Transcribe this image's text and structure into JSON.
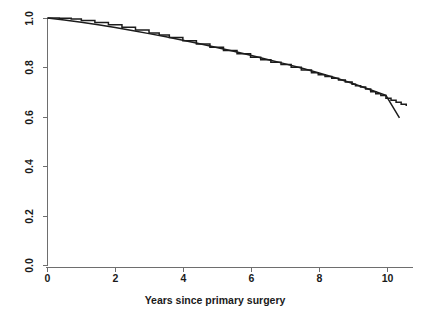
{
  "chart_data": {
    "type": "line",
    "title": "",
    "subtitle": "",
    "xlabel": "Years since primary surgery",
    "ylabel": "",
    "xlim": [
      0,
      10.8
    ],
    "ylim": [
      0.0,
      1.0
    ],
    "grid": false,
    "legend": null,
    "legend_position": "none",
    "x_ticks": [
      0,
      2,
      4,
      6,
      8,
      10
    ],
    "x_tick_labels": [
      "0",
      "2",
      "4",
      "6",
      "8",
      "10"
    ],
    "y_ticks": [
      0.0,
      0.2,
      0.4,
      0.6,
      0.8,
      1.0
    ],
    "y_tick_labels": [
      "0.0",
      "0.2",
      "0.4",
      "0.6",
      "0.8",
      "1.0"
    ],
    "y_tick_rotation_degrees": 90,
    "line_color": "#1c1c1c",
    "axis_color": "#6e6e6e",
    "background_color": "#ffffff",
    "series": [
      {
        "name": "Observed survival (Kaplan-Meier, stepped)",
        "style": "step",
        "x": [
          0.0,
          0.35,
          0.7,
          1.0,
          1.4,
          1.8,
          2.2,
          2.6,
          3.0,
          3.3,
          3.6,
          4.0,
          4.4,
          4.8,
          5.2,
          5.6,
          6.0,
          6.3,
          6.6,
          6.9,
          7.2,
          7.5,
          7.8,
          8.0,
          8.2,
          8.4,
          8.6,
          8.8,
          9.0,
          9.1,
          9.25,
          9.4,
          9.55,
          9.7,
          9.85,
          10.0,
          10.15,
          10.3,
          10.45,
          10.6
        ],
        "values": [
          1.0,
          0.999,
          0.996,
          0.99,
          0.982,
          0.973,
          0.963,
          0.952,
          0.94,
          0.931,
          0.921,
          0.908,
          0.895,
          0.882,
          0.869,
          0.856,
          0.842,
          0.832,
          0.822,
          0.812,
          0.801,
          0.79,
          0.779,
          0.771,
          0.764,
          0.757,
          0.75,
          0.742,
          0.733,
          0.727,
          0.722,
          0.714,
          0.703,
          0.695,
          0.687,
          0.676,
          0.668,
          0.66,
          0.652,
          0.645
        ]
      },
      {
        "name": "Expected survival (smooth)",
        "style": "line",
        "x": [
          0.0,
          0.5,
          1.0,
          1.5,
          2.0,
          2.5,
          3.0,
          3.5,
          4.0,
          4.5,
          5.0,
          5.5,
          6.0,
          6.5,
          7.0,
          7.5,
          8.0,
          8.5,
          9.0,
          9.5,
          10.0,
          10.4
        ],
        "values": [
          1.0,
          0.992,
          0.983,
          0.973,
          0.962,
          0.95,
          0.937,
          0.924,
          0.91,
          0.896,
          0.881,
          0.866,
          0.85,
          0.833,
          0.816,
          0.798,
          0.779,
          0.759,
          0.737,
          0.713,
          0.688,
          0.597
        ]
      }
    ]
  }
}
